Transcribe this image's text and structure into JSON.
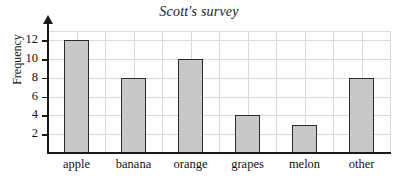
{
  "chart_data": {
    "type": "bar",
    "title": "Scott's survey",
    "xlabel": "",
    "ylabel": "Frequency",
    "categories": [
      "apple",
      "banana",
      "orange",
      "grapes",
      "melon",
      "other"
    ],
    "values": [
      12,
      8,
      10,
      4,
      3,
      8
    ],
    "ylim": [
      0,
      13
    ],
    "ytick_labels": [
      "2",
      "4",
      "6",
      "8",
      "10",
      "12"
    ],
    "ytick_values": [
      2,
      4,
      6,
      8,
      10,
      12
    ],
    "grid": true,
    "grid_interval": 2,
    "legend": "none",
    "series": [
      {
        "name": "Frequency",
        "values": [
          12,
          8,
          10,
          4,
          3,
          8
        ]
      }
    ]
  },
  "style": {
    "bar_fill": "#c8c8c8",
    "bar_stroke": "#2b2b2b",
    "grid_color": "#d9d9d9",
    "axis_color": "#1a1a1a",
    "text_color": "#111111",
    "background": "#ffffff"
  }
}
